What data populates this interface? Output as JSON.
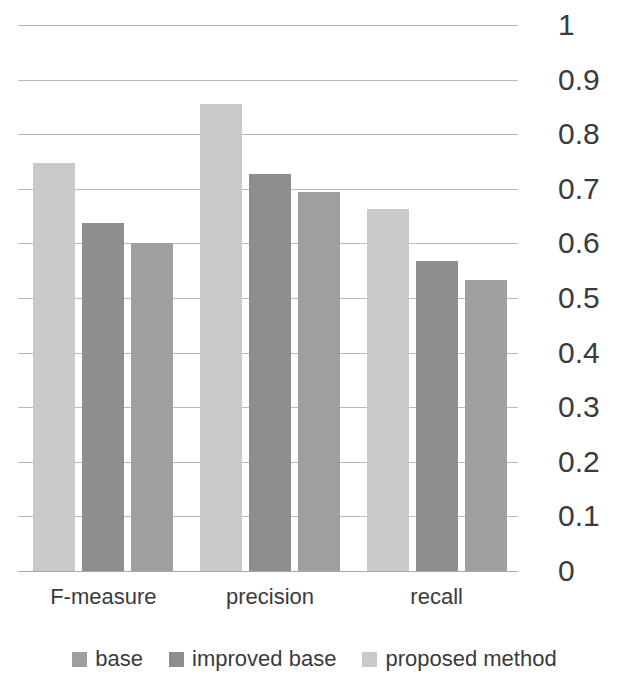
{
  "chart_data": {
    "type": "bar",
    "title": "",
    "subtitle": "",
    "xlabel": "",
    "ylabel": "",
    "categories": [
      "F-measure",
      "precision",
      "recall"
    ],
    "series": [
      {
        "name": "base",
        "color": "#9f9f9f",
        "values": [
          0.6,
          0.695,
          0.533
        ]
      },
      {
        "name": "improved base",
        "color": "#8e8e8e",
        "values": [
          0.637,
          0.727,
          0.567
        ]
      },
      {
        "name": "proposed method",
        "color": "#c9c9c9",
        "values": [
          0.748,
          0.855,
          0.663
        ]
      }
    ],
    "bar_draw_order": [
      "proposed method",
      "improved base",
      "base"
    ],
    "ylim": [
      0,
      1
    ],
    "y_ticks": [
      0,
      0.1,
      0.2,
      0.3,
      0.4,
      0.5,
      0.6,
      0.7,
      0.8,
      0.9,
      1
    ],
    "y_tick_labels": [
      "0",
      "0.1",
      "0.2",
      "0.3",
      "0.4",
      "0.5",
      "0.6",
      "0.7",
      "0.8",
      "0.9",
      "1"
    ],
    "grid": true,
    "grid_axis": "y",
    "legend_position": "bottom",
    "y_axis_position": "right"
  }
}
